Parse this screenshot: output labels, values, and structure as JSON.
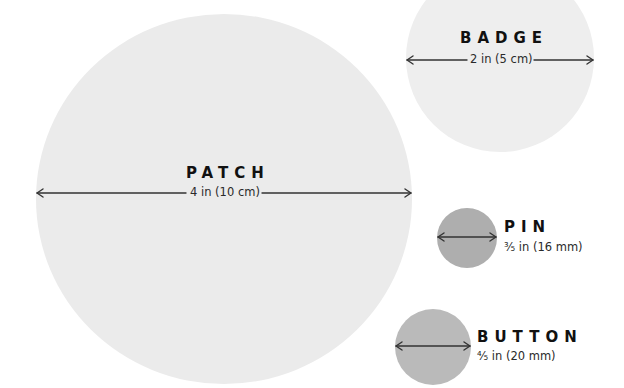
{
  "colors": {
    "background": "#ffffff",
    "patch": "#ebebeb",
    "badge": "#eeeeee",
    "pin": "#aeaeae",
    "button": "#bababa",
    "arrow": "#333333",
    "text": "#111111"
  },
  "items": {
    "patch": {
      "label": "PATCH",
      "size": "4 in (10 cm)"
    },
    "badge": {
      "label": "BADGE",
      "size": "2 in (5 cm)"
    },
    "pin": {
      "label": "PIN",
      "size": "⅗ in (16 mm)"
    },
    "button": {
      "label": "BUTTON",
      "size": "⅘ in (20 mm)"
    }
  }
}
